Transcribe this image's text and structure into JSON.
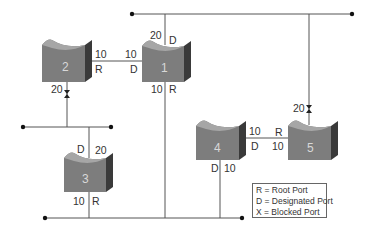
{
  "diagram": {
    "type": "spanning-tree-topology",
    "colors": {
      "line": "#555555",
      "switch_front": "#7d7d7d",
      "switch_top": "#a6a6a6",
      "switch_side": "#3a3a3a",
      "switch_label": "#d8d8d8",
      "text": "#333333"
    },
    "switches": [
      {
        "id": "1",
        "label": "1"
      },
      {
        "id": "2",
        "label": "2"
      },
      {
        "id": "3",
        "label": "3"
      },
      {
        "id": "4",
        "label": "4"
      },
      {
        "id": "5",
        "label": "5"
      }
    ],
    "port_labels": {
      "s2_right_cost": "10",
      "s2_right_role": "R",
      "s1_left_cost": "10",
      "s1_left_role": "D",
      "s1_top_cost": "20",
      "s1_top_role": "D",
      "s1_bottom_cost": "10",
      "s1_bottom_role": "R",
      "s2_bottom_cost": "20",
      "s2_bottom_role": "X",
      "s3_top_role": "D",
      "s3_top_cost": "20",
      "s3_bottom_cost": "10",
      "s3_bottom_role": "R",
      "s4_right_cost": "10",
      "s4_right_role": "D",
      "s5_left_role": "R",
      "s5_left_cost": "10",
      "s5_top_cost": "20",
      "s5_top_role": "X",
      "s4_bottom_role": "D",
      "s4_bottom_cost": "10"
    },
    "legend": [
      {
        "text": "R = Root Port"
      },
      {
        "text": "D = Designated Port"
      },
      {
        "text": "X = Blocked Port"
      }
    ]
  }
}
